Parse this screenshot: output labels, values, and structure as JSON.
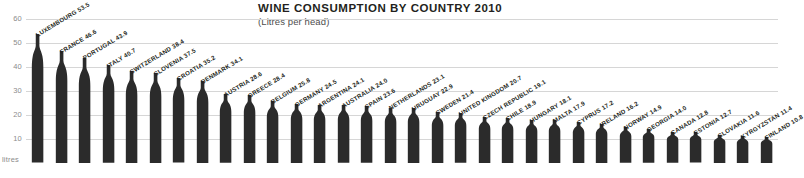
{
  "header": {
    "title": "WINE CONSUMPTION BY COUNTRY 2010",
    "subtitle": "(Litres per head)"
  },
  "axis": {
    "unit_label": "litres",
    "ticks": [
      "60",
      "50",
      "40",
      "30",
      "20",
      "10"
    ]
  },
  "chart_data": {
    "type": "bar",
    "title": "WINE CONSUMPTION BY COUNTRY 2010",
    "subtitle": "(Litres per head)",
    "xlabel": "",
    "ylabel": "litres",
    "ylim": [
      0,
      62
    ],
    "yticks": [
      10,
      20,
      30,
      40,
      50,
      60
    ],
    "grid": true,
    "legend": "none",
    "bar_style": "wine-bottle-silhouette",
    "bar_color": "#2b2b2b",
    "categories": [
      "LUXEMBOURG",
      "FRANCE",
      "PORTUGAL",
      "ITALY",
      "SWITZERLAND",
      "SLOVENIA",
      "CROATIA",
      "DENMARK",
      "AUSTRIA",
      "GREECE",
      "BELGIUM",
      "GERMANY",
      "ARGENTINA",
      "AUSTRALIA",
      "SPAIN",
      "NETHERLANDS",
      "URUGUAY",
      "SWEDEN",
      "UNITED KINGDOM",
      "CZECH REPUBLIC",
      "CHILE",
      "HUNGARY",
      "MALTA",
      "CYPRUS",
      "IRELAND",
      "NORWAY",
      "GEORGIA",
      "CANADA",
      "ESTONIA",
      "SLOVAKIA",
      "KYRGYZSTAN",
      "FINLAND"
    ],
    "values": [
      53.5,
      46.6,
      43.9,
      40.7,
      38.4,
      37.5,
      35.2,
      34.1,
      28.6,
      28.4,
      25.8,
      24.5,
      24.1,
      24.0,
      23.6,
      23.1,
      22.9,
      21.4,
      20.7,
      19.1,
      18.9,
      18.1,
      17.9,
      17.2,
      16.2,
      14.9,
      14.0,
      12.8,
      12.7,
      11.6,
      11.4,
      10.8
    ],
    "labels": [
      "LUXEMBOURG 53.5",
      "FRANCE 46.6",
      "PORTUGAL 43.9",
      "ITALY 40.7",
      "SWITZERLAND 38.4",
      "SLOVENIA 37.5",
      "CROATIA 35.2",
      "DENMARK 34.1",
      "AUSTRIA 28.6",
      "GREECE 28.4",
      "BELGIUM 25.8",
      "GERMANY 24.5",
      "ARGENTINA 24.1",
      "AUSTRALIA 24.0",
      "SPAIN 23.6",
      "NETHERLANDS 23.1",
      "URUGUAY 22.9",
      "SWEDEN 21.4",
      "UNITED KINGDOM 20.7",
      "CZECH REPUBLIC 19.1",
      "CHILE 18.9",
      "HUNGARY 18.1",
      "MALTA 17.9",
      "CYPRUS 17.2",
      "IRELAND 16.2",
      "NORWAY 14.9",
      "GEORGIA 14.0",
      "CANADA 12.8",
      "ESTONIA 12.7",
      "SLOVAKIA 11.6",
      "KYRGYZSTAN 11.4",
      "FINLAND 10.8"
    ]
  }
}
